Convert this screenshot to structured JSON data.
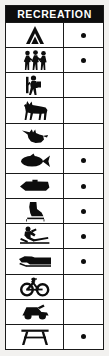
{
  "panel": {
    "title": "RECREATION",
    "colors": {
      "header_background": "#0d0d0d",
      "header_text": "#ffffff",
      "border": "#1a1a1a",
      "cell_background": "#ffffff",
      "page_background": "#f2f1ef",
      "symbol": "#0d0d0d"
    }
  },
  "legend": {
    "column_count": 2,
    "row_count": 12,
    "rows": [
      {
        "icon": "tent-camping-icon",
        "activity": "Camping",
        "marked": true,
        "dot": "●"
      },
      {
        "icon": "hikers-group-icon",
        "activity": "Hiking",
        "marked": true,
        "dot": "●"
      },
      {
        "icon": "backpacker-icon",
        "activity": "Backpacking",
        "marked": false,
        "dot": ""
      },
      {
        "icon": "horse-riding-icon",
        "activity": "Horseback Riding",
        "marked": false,
        "dot": ""
      },
      {
        "icon": "bird-hunting-icon",
        "activity": "Hunting",
        "marked": false,
        "dot": ""
      },
      {
        "icon": "fish-icon",
        "activity": "Fishing",
        "marked": true,
        "dot": "●"
      },
      {
        "icon": "boat-icon",
        "activity": "Boating",
        "marked": true,
        "dot": "●"
      },
      {
        "icon": "ice-skate-icon",
        "activity": "Ice Skating",
        "marked": true,
        "dot": "●"
      },
      {
        "icon": "skier-icon",
        "activity": "Skiing",
        "marked": true,
        "dot": "●"
      },
      {
        "icon": "snowmobile-icon",
        "activity": "Snowmobiling",
        "marked": true,
        "dot": "●"
      },
      {
        "icon": "bicycle-icon",
        "activity": "Bicycling",
        "marked": false,
        "dot": ""
      },
      {
        "icon": "atv-offroad-vehicle-icon",
        "activity": "Off-Road Vehicle",
        "marked": false,
        "dot": ""
      },
      {
        "icon": "picnic-table-icon",
        "activity": "Picnicking",
        "marked": true,
        "dot": "●"
      }
    ]
  }
}
